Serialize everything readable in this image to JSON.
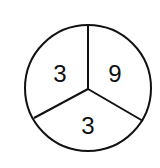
{
  "diagram": {
    "type": "circle-divided-into-three-sectors",
    "sectors": [
      {
        "position": "upper-left",
        "value": "3"
      },
      {
        "position": "upper-right",
        "value": "9"
      },
      {
        "position": "bottom",
        "value": "3"
      }
    ],
    "stroke_color": "#111111",
    "background_color": "#ffffff"
  }
}
